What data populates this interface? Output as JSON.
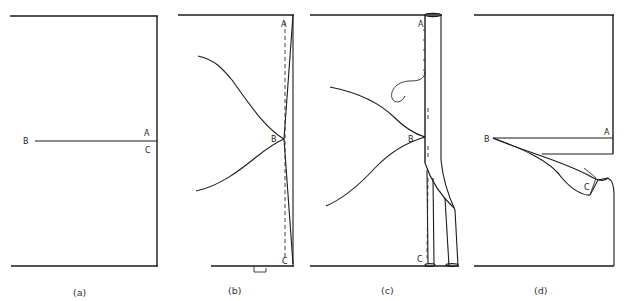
{
  "figure": {
    "panels": [
      {
        "id": "a",
        "caption": "(a)",
        "points": {
          "A": "A",
          "B": "B",
          "C": "C"
        }
      },
      {
        "id": "b",
        "caption": "(b)",
        "points": {
          "A": "A",
          "B": "B",
          "C": "C"
        }
      },
      {
        "id": "c",
        "caption": "(c)",
        "points": {
          "A": "A",
          "B": "B",
          "C": "C"
        }
      },
      {
        "id": "d",
        "caption": "(d)",
        "points": {
          "A": "A",
          "B": "B",
          "C": "C"
        }
      }
    ],
    "colors": {
      "line": "#1a1a1a",
      "background": "#ffffff"
    }
  }
}
